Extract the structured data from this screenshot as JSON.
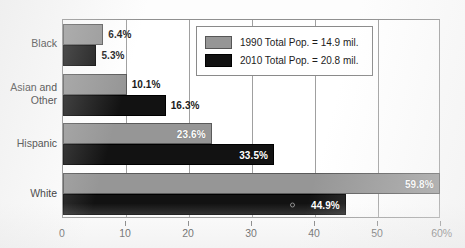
{
  "chart_data": {
    "type": "bar",
    "orientation": "horizontal",
    "title": "",
    "xlabel": "",
    "ylabel": "",
    "categories": [
      "Black",
      "Asian and\nOther",
      "Hispanic",
      "White"
    ],
    "series": [
      {
        "name": "1990 Total Pop. = 14.9 mil.",
        "color": "#969696",
        "values": [
          6.4,
          10.1,
          23.6,
          59.8
        ],
        "labels": [
          "6.4%",
          "10.1%",
          "23.6%",
          "59.8%"
        ]
      },
      {
        "name": "2010 Total Pop. = 20.8 mil.",
        "color": "#121212",
        "values": [
          5.3,
          16.3,
          33.5,
          44.9
        ],
        "labels": [
          "5.3%",
          "16.3%",
          "33.5%",
          "44.9%"
        ]
      }
    ],
    "xlim": [
      0,
      60
    ],
    "xticks": [
      0,
      10,
      20,
      30,
      40,
      50,
      60
    ],
    "xtick_labels": [
      "0",
      "10",
      "20",
      "30",
      "40",
      "50",
      "60%"
    ],
    "grid": "vertical",
    "legend_position": "upper right inside plot"
  },
  "legend": {
    "entries": [
      {
        "label": "1990 Total Pop. = 14.9 mil.",
        "swatch": "gray-swatch"
      },
      {
        "label": "2010 Total Pop. = 20.8 mil.",
        "swatch": "black-swatch"
      }
    ]
  }
}
